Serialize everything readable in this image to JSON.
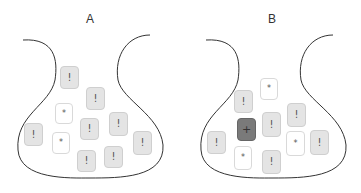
{
  "panels": [
    {
      "label": "A",
      "tiles": [
        {
          "type": "alert",
          "glyph": "!",
          "x": 60,
          "y": 66,
          "w": 19,
          "h": 23
        },
        {
          "type": "alert",
          "glyph": "!",
          "x": 86,
          "y": 87,
          "w": 19,
          "h": 23
        },
        {
          "type": "star",
          "glyph": "*",
          "x": 55,
          "y": 103,
          "w": 18,
          "h": 21
        },
        {
          "type": "alert",
          "glyph": "!",
          "x": 80,
          "y": 118,
          "w": 19,
          "h": 22
        },
        {
          "type": "alert",
          "glyph": "!",
          "x": 109,
          "y": 112,
          "w": 19,
          "h": 24
        },
        {
          "type": "alert",
          "glyph": "!",
          "x": 24,
          "y": 123,
          "w": 19,
          "h": 23
        },
        {
          "type": "star",
          "glyph": "*",
          "x": 52,
          "y": 132,
          "w": 18,
          "h": 22
        },
        {
          "type": "alert",
          "glyph": "!",
          "x": 77,
          "y": 150,
          "w": 19,
          "h": 22
        },
        {
          "type": "alert",
          "glyph": "!",
          "x": 104,
          "y": 146,
          "w": 19,
          "h": 22
        },
        {
          "type": "alert",
          "glyph": "!",
          "x": 133,
          "y": 131,
          "w": 19,
          "h": 24
        }
      ]
    },
    {
      "label": "B",
      "tiles": [
        {
          "type": "star",
          "glyph": "*",
          "x": 260,
          "y": 78,
          "w": 18,
          "h": 22
        },
        {
          "type": "alert",
          "glyph": "!",
          "x": 234,
          "y": 90,
          "w": 19,
          "h": 23
        },
        {
          "type": "alert",
          "glyph": "!",
          "x": 287,
          "y": 103,
          "w": 19,
          "h": 24
        },
        {
          "type": "alert",
          "glyph": "!",
          "x": 262,
          "y": 112,
          "w": 19,
          "h": 25
        },
        {
          "type": "plus",
          "glyph": "+",
          "x": 237,
          "y": 118,
          "w": 19,
          "h": 23
        },
        {
          "type": "alert",
          "glyph": "!",
          "x": 207,
          "y": 131,
          "w": 19,
          "h": 23
        },
        {
          "type": "star",
          "glyph": "*",
          "x": 234,
          "y": 146,
          "w": 18,
          "h": 24
        },
        {
          "type": "star",
          "glyph": "*",
          "x": 286,
          "y": 131,
          "w": 19,
          "h": 25
        },
        {
          "type": "alert",
          "glyph": "!",
          "x": 310,
          "y": 130,
          "w": 19,
          "h": 25
        },
        {
          "type": "alert",
          "glyph": "!",
          "x": 262,
          "y": 150,
          "w": 19,
          "h": 24
        }
      ]
    }
  ]
}
